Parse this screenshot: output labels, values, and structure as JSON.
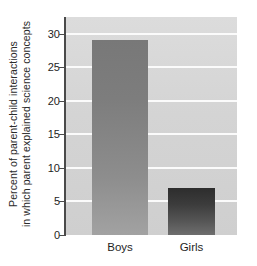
{
  "chart_data": {
    "type": "bar",
    "title": "",
    "xlabel": "",
    "ylabel_line1": "Percent of parent-child interactions",
    "ylabel_line2": "in which parent explained science concepts",
    "categories": [
      "Boys",
      "Girls"
    ],
    "values": [
      29,
      7
    ],
    "series": [
      {
        "name": "Percent of parent-child interactions in which parent explained science concepts",
        "values": [
          29,
          7
        ]
      }
    ],
    "ylim": [
      0,
      32.5
    ],
    "yticks": [
      0,
      5,
      10,
      15,
      20,
      25,
      30
    ],
    "ytick_labels": [
      "0",
      "5",
      "10",
      "15",
      "20",
      "25",
      "30"
    ],
    "grid": true,
    "grid_orientation": "horizontal",
    "legend": "none",
    "bar_colors": [
      "#8a8a8a",
      "#3d3d3d"
    ],
    "plot_background": "#d5d5d5",
    "gridline_color": "#fbfbfb",
    "axis_color": "#4a4a4a",
    "text_color": "#1e1e1e"
  }
}
